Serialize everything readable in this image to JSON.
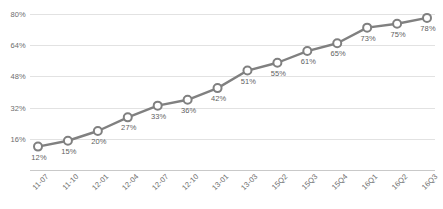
{
  "chart_data": {
    "type": "line",
    "title": "",
    "subtitle": "",
    "xlabel": "",
    "ylabel": "",
    "ylim": [
      0,
      80
    ],
    "grid": true,
    "legend": false,
    "legend_position": "none",
    "y_ticks": [
      {
        "value": 80,
        "label": "80%"
      },
      {
        "value": 64,
        "label": "64%"
      },
      {
        "value": 48,
        "label": "48%"
      },
      {
        "value": 32,
        "label": "32%"
      },
      {
        "value": 16,
        "label": "16%"
      },
      {
        "value": 0,
        "label": ""
      }
    ],
    "categories": [
      "11-07",
      "11-10",
      "12-01",
      "12-04",
      "12-07",
      "12-10",
      "13-01",
      "13-03",
      "15Q2",
      "15Q3",
      "15Q4",
      "16Q1",
      "16Q2",
      "16Q3"
    ],
    "values": [
      12,
      15,
      20,
      27,
      33,
      36,
      42,
      51,
      55,
      61,
      65,
      73,
      75,
      78
    ],
    "point_labels": [
      "12%",
      "15%",
      "20%",
      "27%",
      "33%",
      "36%",
      "42%",
      "51%",
      "55%",
      "61%",
      "65%",
      "73%",
      "75%",
      "78%"
    ],
    "series": [
      {
        "name": "",
        "values": [
          12,
          15,
          20,
          27,
          33,
          36,
          42,
          51,
          55,
          61,
          65,
          73,
          75,
          78
        ]
      }
    ],
    "style": {
      "line_color": "#808080",
      "line_width": 2.4,
      "marker_shape": "circle",
      "marker_fill": "#ffffff",
      "marker_stroke": "#808080",
      "marker_radius": 4,
      "gridline_color": "#e2e2e2",
      "axis_color": "#c9c9c9",
      "tick_label_color": "#6d6d6d",
      "point_label_color": "#5f5f5f",
      "background": "#ffffff",
      "x_label_rotation": -45
    }
  }
}
